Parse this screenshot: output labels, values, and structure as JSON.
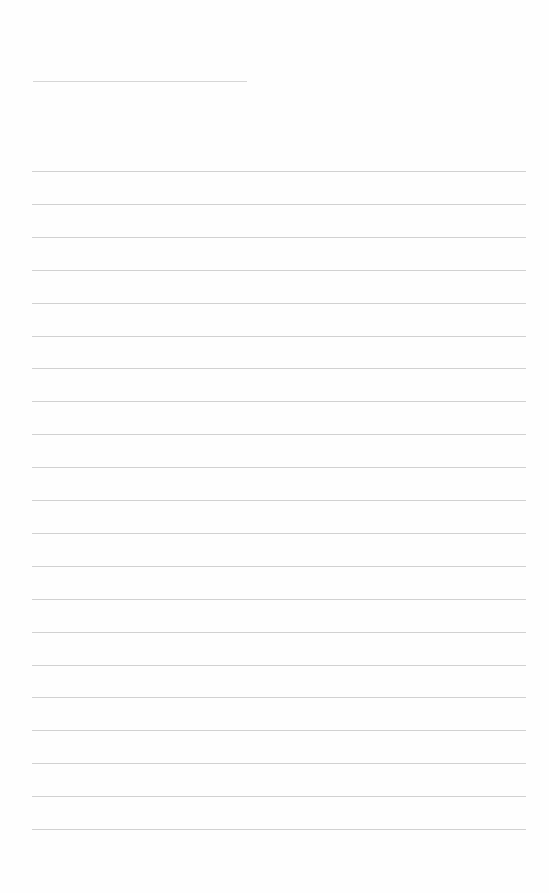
{
  "page": {
    "type": "blank lined writing sheet",
    "background_color": "#fefefe",
    "rule_color": "#c9c9c9",
    "header_rule": {
      "x_start": 33,
      "x_end": 247,
      "y": 81,
      "text": ""
    },
    "body_rules": {
      "count": 21,
      "x_start": 32,
      "x_end": 526,
      "first_y": 171,
      "last_y": 829,
      "spacing": 32.9,
      "lines": [
        "",
        "",
        "",
        "",
        "",
        "",
        "",
        "",
        "",
        "",
        "",
        "",
        "",
        "",
        "",
        "",
        "",
        "",
        "",
        "",
        ""
      ]
    }
  }
}
